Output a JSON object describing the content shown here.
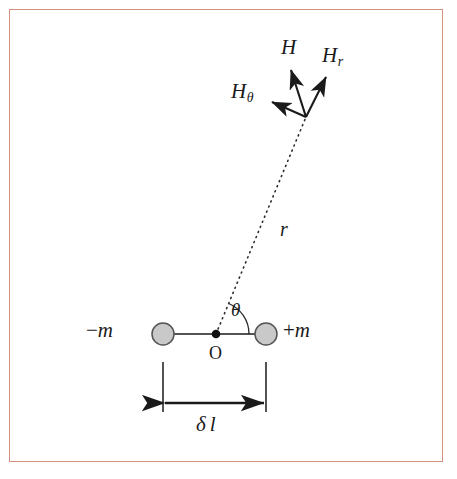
{
  "figure": {
    "kind": "physics-vector-diagram",
    "frame_border_color": "#d4917f",
    "background_color": "#ffffff",
    "ink_color": "#1a1a1a",
    "pole_fill_color": "#c9c9c9",
    "pole_stroke_color": "#555555"
  },
  "labels": {
    "H": "H",
    "H_r_base": "H",
    "H_r_sub": "r",
    "H_theta_base": "H",
    "H_theta_sub": "θ",
    "r": "r",
    "theta": "θ",
    "minus_m_sign": "−",
    "minus_m_base": "m",
    "plus_m_sign": "+",
    "plus_m_base": "m",
    "origin": "O",
    "delta_l_sign": "δ",
    "delta_l_base": "l",
    "bottom_cut_text": "––   ––––   –––––          –     –      –  –––"
  },
  "geometry": {
    "field_point": {
      "x": 306,
      "y": 117
    },
    "origin_point": {
      "x": 216,
      "y": 334
    },
    "pole_negative": {
      "x": 163,
      "y": 334,
      "r": 11
    },
    "pole_positive": {
      "x": 266,
      "y": 334,
      "r": 11
    },
    "axis_line": {
      "x1": 163,
      "y1": 334,
      "x2": 266,
      "y2": 334
    },
    "radial_dotted_line": {
      "x1": 216,
      "y1": 334,
      "x2": 306,
      "y2": 117
    },
    "theta_arc_radius": 33,
    "vectors": [
      {
        "name": "H",
        "tip": {
          "x": 291,
          "y": 70
        }
      },
      {
        "name": "H_r",
        "tip": {
          "x": 326,
          "y": 77
        }
      },
      {
        "name": "H_theta",
        "tip": {
          "x": 272,
          "y": 102
        }
      }
    ],
    "dimension": {
      "ext_left_x": 163,
      "ext_right_x": 266,
      "ext_top_y": 362,
      "ext_bottom_y": 412,
      "arrow_y": 403
    }
  }
}
